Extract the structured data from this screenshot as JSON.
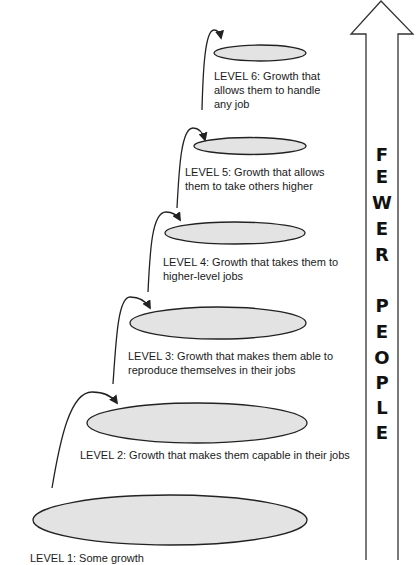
{
  "diagram": {
    "type": "growth-levels-pyramid",
    "side_arrow": {
      "direction": "up",
      "letters": [
        "F",
        "E",
        "W",
        "E",
        "R",
        "",
        "P",
        "E",
        "O",
        "P",
        "L",
        "E"
      ],
      "letter_y": [
        155,
        177,
        203,
        229,
        255,
        null,
        306,
        332,
        358,
        383,
        408,
        433
      ],
      "label": "FEWER PEOPLE"
    },
    "levels": [
      {
        "id": 1,
        "lines": [
          "LEVEL 1: Some growth"
        ],
        "ellipse": {
          "cx": 170,
          "cy": 520,
          "rx": 137,
          "ry": 25
        },
        "text_x": 30,
        "text_y": 551
      },
      {
        "id": 2,
        "lines": [
          "LEVEL 2: Growth that makes them capable in their jobs"
        ],
        "ellipse": {
          "cx": 197,
          "cy": 423,
          "rx": 110,
          "ry": 20
        },
        "text_x": 80,
        "text_y": 448
      },
      {
        "id": 3,
        "lines": [
          "LEVEL 3: Growth that makes them able to",
          "reproduce themselves in their jobs"
        ],
        "ellipse": {
          "cx": 218,
          "cy": 323,
          "rx": 88,
          "ry": 16
        },
        "text_x": 128,
        "text_y": 349
      },
      {
        "id": 4,
        "lines": [
          "LEVEL 4: Growth that takes them to",
          "higher-level jobs"
        ],
        "ellipse": {
          "cx": 235,
          "cy": 233,
          "rx": 70,
          "ry": 11
        },
        "text_x": 163,
        "text_y": 255
      },
      {
        "id": 5,
        "lines": [
          "LEVEL 5: Growth that allows",
          "them to take others higher"
        ],
        "ellipse": {
          "cx": 250,
          "cy": 146,
          "rx": 56,
          "ry": 8.5
        },
        "text_x": 185,
        "text_y": 165
      },
      {
        "id": 6,
        "lines": [
          "LEVEL 6: Growth that",
          "allows them to handle",
          "any job"
        ],
        "ellipse": {
          "cx": 260,
          "cy": 53,
          "rx": 46,
          "ry": 8
        },
        "text_x": 214,
        "text_y": 69
      }
    ],
    "curved_arrows": [
      {
        "from": "level-1",
        "to": "level-2",
        "d": "M52,488 C60,440 70,392 92,392 C105,392 112,396 117,403"
      },
      {
        "from": "level-2",
        "to": "level-3",
        "d": "M113,384 C116,340 118,297 130,297 C140,297 146,301 150,308"
      },
      {
        "from": "level-3",
        "to": "level-4",
        "d": "M148,292 C150,250 152,212 166,212 C173,212 177,215 180,220"
      },
      {
        "from": "level-4",
        "to": "level-5",
        "d": "M177,208 C179,170 181,128 193,128 C199,128 203,133 205,140"
      },
      {
        "from": "level-5",
        "to": "level-6",
        "d": "M202,110 C203,70 205,30 214,30 C218,30 220,33 221,38"
      }
    ],
    "colors": {
      "ellipse_fill": "#e3e3e3",
      "stroke": "#222222",
      "text": "#1a1a1a"
    }
  }
}
